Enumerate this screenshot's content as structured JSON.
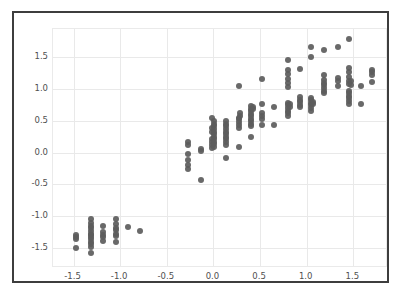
{
  "figure": {
    "background_color": "#ffffff",
    "border_color": "#3d3d3d",
    "marker_color": "#5c5c5c",
    "grid_color": "#e9e9e9"
  },
  "chart_data": {
    "type": "scatter",
    "title": "",
    "xlabel": "",
    "ylabel": "",
    "xlim": [
      -1.72,
      1.85
    ],
    "ylim": [
      -1.78,
      1.94
    ],
    "grid": true,
    "legend": null,
    "marker_color": "#5c5c5c",
    "marker_size": 6,
    "xticks": [
      -1.5,
      -1.0,
      -0.5,
      0.0,
      0.5,
      1.0,
      1.5
    ],
    "xticklabels": [
      "-1.5",
      "-1.0",
      "-0.5",
      "0.0",
      "0.5",
      "1.0",
      "1.5"
    ],
    "yticks": [
      -1.5,
      -1.0,
      -0.5,
      0.0,
      0.5,
      1.0,
      1.5
    ],
    "yticklabels": [
      "-1.5",
      "-1.0",
      "-0.5",
      "0.0",
      "0.5",
      "1.0",
      "1.5"
    ],
    "n_points": 191,
    "points": [
      [
        -1.47,
        -1.29
      ],
      [
        -1.47,
        -1.33
      ],
      [
        -1.47,
        -1.36
      ],
      [
        -1.47,
        -1.5
      ],
      [
        -1.31,
        -1.04
      ],
      [
        -1.31,
        -1.1
      ],
      [
        -1.31,
        -1.15
      ],
      [
        -1.31,
        -1.19
      ],
      [
        -1.31,
        -1.23
      ],
      [
        -1.31,
        -1.27
      ],
      [
        -1.31,
        -1.3
      ],
      [
        -1.31,
        -1.33
      ],
      [
        -1.31,
        -1.36
      ],
      [
        -1.31,
        -1.4
      ],
      [
        -1.31,
        -1.44
      ],
      [
        -1.31,
        -1.48
      ],
      [
        -1.31,
        -1.58
      ],
      [
        -1.18,
        -1.15
      ],
      [
        -1.18,
        -1.24
      ],
      [
        -1.18,
        -1.29
      ],
      [
        -1.18,
        -1.33
      ],
      [
        -1.18,
        -1.38
      ],
      [
        -1.05,
        -1.04
      ],
      [
        -1.05,
        -1.12
      ],
      [
        -1.05,
        -1.18
      ],
      [
        -1.05,
        -1.22
      ],
      [
        -1.05,
        -1.27
      ],
      [
        -1.05,
        -1.31
      ],
      [
        -1.05,
        -1.41
      ],
      [
        -0.92,
        -1.16
      ],
      [
        -0.79,
        -1.23
      ],
      [
        -0.27,
        0.17
      ],
      [
        -0.27,
        0.12
      ],
      [
        -0.27,
        -0.02
      ],
      [
        -0.27,
        -0.12
      ],
      [
        -0.27,
        -0.19
      ],
      [
        -0.27,
        -0.26
      ],
      [
        -0.13,
        0.06
      ],
      [
        -0.13,
        0.02
      ],
      [
        -0.13,
        -0.43
      ],
      [
        -0.02,
        0.54
      ],
      [
        -0.02,
        0.38
      ],
      [
        -0.02,
        0.33
      ],
      [
        -0.02,
        0.21
      ],
      [
        -0.02,
        0.17
      ],
      [
        -0.02,
        0.12
      ],
      [
        -0.02,
        0.08
      ],
      [
        0.01,
        0.5
      ],
      [
        0.01,
        0.45
      ],
      [
        0.01,
        0.41
      ],
      [
        0.01,
        0.37
      ],
      [
        0.01,
        0.33
      ],
      [
        0.01,
        0.29
      ],
      [
        0.01,
        0.25
      ],
      [
        0.01,
        0.21
      ],
      [
        0.01,
        0.17
      ],
      [
        0.01,
        0.13
      ],
      [
        0.01,
        0.09
      ],
      [
        0.13,
        0.5
      ],
      [
        0.13,
        0.45
      ],
      [
        0.13,
        0.41
      ],
      [
        0.13,
        0.37
      ],
      [
        0.13,
        0.33
      ],
      [
        0.13,
        0.29
      ],
      [
        0.13,
        0.25
      ],
      [
        0.13,
        0.21
      ],
      [
        0.13,
        0.17
      ],
      [
        0.13,
        0.12
      ],
      [
        0.13,
        -0.08
      ],
      [
        0.27,
        1.05
      ],
      [
        0.27,
        0.55
      ],
      [
        0.27,
        0.52
      ],
      [
        0.27,
        0.48
      ],
      [
        0.27,
        0.44
      ],
      [
        0.27,
        0.38
      ],
      [
        0.27,
        0.09
      ],
      [
        0.29,
        0.62
      ],
      [
        0.29,
        0.58
      ],
      [
        0.4,
        0.73
      ],
      [
        0.4,
        0.69
      ],
      [
        0.4,
        0.65
      ],
      [
        0.4,
        0.61
      ],
      [
        0.4,
        0.57
      ],
      [
        0.4,
        0.53
      ],
      [
        0.4,
        0.49
      ],
      [
        0.4,
        0.45
      ],
      [
        0.4,
        0.41
      ],
      [
        0.4,
        0.25
      ],
      [
        0.42,
        0.72
      ],
      [
        0.42,
        0.68
      ],
      [
        0.52,
        1.16
      ],
      [
        0.52,
        0.77
      ],
      [
        0.52,
        0.62
      ],
      [
        0.52,
        0.57
      ],
      [
        0.52,
        0.52
      ],
      [
        0.52,
        0.43
      ],
      [
        0.65,
        0.71
      ],
      [
        0.65,
        0.43
      ],
      [
        0.8,
        1.45
      ],
      [
        0.8,
        1.3
      ],
      [
        0.8,
        1.23
      ],
      [
        0.8,
        1.16
      ],
      [
        0.8,
        1.09
      ],
      [
        0.8,
        1.03
      ],
      [
        0.8,
        0.78
      ],
      [
        0.8,
        0.74
      ],
      [
        0.8,
        0.7
      ],
      [
        0.8,
        0.66
      ],
      [
        0.8,
        0.62
      ],
      [
        0.8,
        0.58
      ],
      [
        0.82,
        0.76
      ],
      [
        0.82,
        0.72
      ],
      [
        0.93,
        1.32
      ],
      [
        0.93,
        0.88
      ],
      [
        0.93,
        0.83
      ],
      [
        0.93,
        0.79
      ],
      [
        0.93,
        0.75
      ],
      [
        0.93,
        0.71
      ],
      [
        1.05,
        1.66
      ],
      [
        1.05,
        1.5
      ],
      [
        1.05,
        0.86
      ],
      [
        1.05,
        0.82
      ],
      [
        1.05,
        0.78
      ],
      [
        1.05,
        0.74
      ],
      [
        1.05,
        0.7
      ],
      [
        1.05,
        0.66
      ],
      [
        1.07,
        0.8
      ],
      [
        1.07,
        0.76
      ],
      [
        1.19,
        1.61
      ],
      [
        1.19,
        1.22
      ],
      [
        1.19,
        1.14
      ],
      [
        1.19,
        1.1
      ],
      [
        1.19,
        1.06
      ],
      [
        1.19,
        1.02
      ],
      [
        1.19,
        0.97
      ],
      [
        1.19,
        0.93
      ],
      [
        1.33,
        1.66
      ],
      [
        1.33,
        1.17
      ],
      [
        1.33,
        1.12
      ],
      [
        1.33,
        1.04
      ],
      [
        1.45,
        1.79
      ],
      [
        1.45,
        1.33
      ],
      [
        1.45,
        1.26
      ],
      [
        1.45,
        1.19
      ],
      [
        1.45,
        1.13
      ],
      [
        1.45,
        1.08
      ],
      [
        1.45,
        0.97
      ],
      [
        1.45,
        0.93
      ],
      [
        1.45,
        0.89
      ],
      [
        1.45,
        0.85
      ],
      [
        1.45,
        0.81
      ],
      [
        1.45,
        0.77
      ],
      [
        1.47,
        1.12
      ],
      [
        1.47,
        1.06
      ],
      [
        1.58,
        1.05
      ],
      [
        1.58,
        0.77
      ],
      [
        1.7,
        1.3
      ],
      [
        1.7,
        1.26
      ],
      [
        1.7,
        1.22
      ],
      [
        1.7,
        1.11
      ]
    ]
  }
}
